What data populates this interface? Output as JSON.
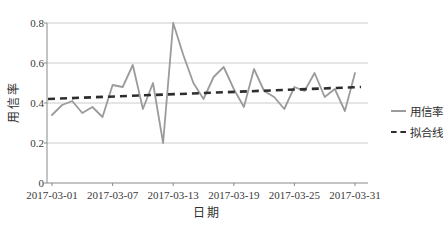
{
  "colors": {
    "background": "#ffffff",
    "grid": "#cccccc",
    "axis": "#8a8a8a",
    "text": "#333333",
    "series_line": "#9b9b9b",
    "trend_line": "#2e2e2e"
  },
  "chart_data": {
    "type": "line",
    "title": "",
    "xlabel": "日期",
    "ylabel": "用信率",
    "grid": true,
    "legend_position": "right",
    "ylim": [
      0,
      0.8
    ],
    "y_tick_labels": [
      "0",
      "0.2",
      "0.4",
      "0.6",
      "0.8"
    ],
    "y_tick_values": [
      0,
      0.2,
      0.4,
      0.6,
      0.8
    ],
    "x_tick_labels": [
      "2017-03-01",
      "2017-03-07",
      "2017-03-13",
      "2017-03-19",
      "2017-03-25",
      "2017-03-31"
    ],
    "x_tick_days": [
      1,
      7,
      13,
      19,
      25,
      31
    ],
    "x_unit": "day",
    "x_start": "2017-03-01",
    "x_end": "2017-03-31",
    "series": [
      {
        "name": "用信率",
        "style": "solid",
        "color": "#9b9b9b",
        "values": [
          0.34,
          0.39,
          0.41,
          0.35,
          0.38,
          0.33,
          0.49,
          0.48,
          0.59,
          0.37,
          0.5,
          0.2,
          0.8,
          0.64,
          0.5,
          0.42,
          0.53,
          0.58,
          0.47,
          0.38,
          0.57,
          0.46,
          0.43,
          0.37,
          0.48,
          0.46,
          0.55,
          0.43,
          0.47,
          0.36,
          0.55
        ]
      },
      {
        "name": "拟合线",
        "style": "dashed",
        "color": "#2e2e2e",
        "trend_start": 0.42,
        "trend_end": 0.48
      }
    ]
  }
}
